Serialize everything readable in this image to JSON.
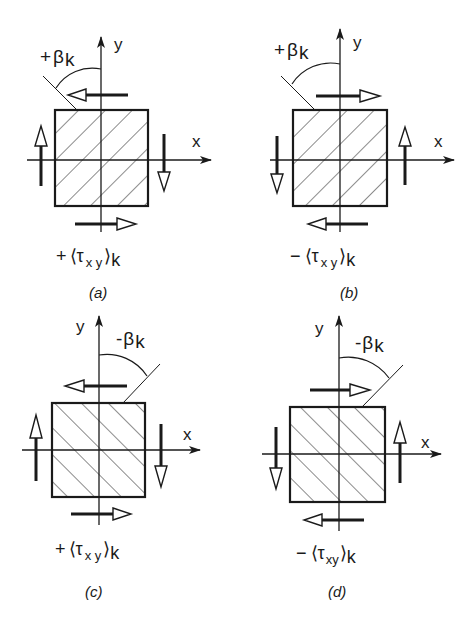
{
  "figure": {
    "panels": [
      {
        "id": "a",
        "panel_label": "(a)",
        "angle_label": "+βk",
        "angle_sign": "+",
        "shear_label": "+⟨τxy⟩k",
        "shear_sign": "+",
        "axis_x": "x",
        "axis_y": "y",
        "hatch_direction": "descending",
        "arrows": {
          "top": "left",
          "bottom": "right",
          "left": "up",
          "right": "down"
        }
      },
      {
        "id": "b",
        "panel_label": "(b)",
        "angle_label": "+βk",
        "angle_sign": "+",
        "shear_label": "−⟨τxy⟩k",
        "shear_sign": "−",
        "axis_x": "x",
        "axis_y": "y",
        "hatch_direction": "descending",
        "arrows": {
          "top": "right",
          "bottom": "left",
          "left": "down",
          "right": "up"
        }
      },
      {
        "id": "c",
        "panel_label": "(c)",
        "angle_label": "-βk",
        "angle_sign": "-",
        "shear_label": "+⟨τxy⟩k",
        "shear_sign": "+",
        "axis_x": "x",
        "axis_y": "y",
        "hatch_direction": "ascending",
        "arrows": {
          "top": "left",
          "bottom": "right",
          "left": "up",
          "right": "down"
        }
      },
      {
        "id": "d",
        "panel_label": "(d)",
        "angle_label": "-βk",
        "angle_sign": "-",
        "shear_label": "−⟨τxy⟩k",
        "shear_sign": "−",
        "axis_x": "x",
        "axis_y": "y",
        "hatch_direction": "ascending",
        "arrows": {
          "top": "right",
          "bottom": "left",
          "left": "down",
          "right": "up"
        }
      }
    ],
    "text": {
      "a_sign": "+",
      "a_beta": "β",
      "a_k": "k",
      "a_y": "y",
      "a_x": "x",
      "a_cap_sign": "+",
      "a_cap_open": "⟨τ",
      "a_cap_xy": "x y",
      "a_cap_close": "⟩",
      "a_cap_k": "k",
      "a_label": "(a)",
      "b_sign": "+",
      "b_beta": "β",
      "b_k": "k",
      "b_y": "y",
      "b_x": "x",
      "b_cap_sign": "−",
      "b_cap_open": "⟨τ",
      "b_cap_xy": "x y",
      "b_cap_close": "⟩",
      "b_cap_k": "k",
      "b_label": "(b)",
      "c_sign": "-",
      "c_beta": "β",
      "c_k": "k",
      "c_y": "y",
      "c_x": "x",
      "c_cap_sign": "+",
      "c_cap_open": "⟨τ",
      "c_cap_xy": "x y",
      "c_cap_close": "⟩",
      "c_cap_k": "k",
      "c_label": "(c)",
      "d_sign": "-",
      "d_beta": "β",
      "d_k": "k",
      "d_y": "y",
      "d_x": "x",
      "d_cap_sign": "−",
      "d_cap_open": "⟨τ",
      "d_cap_xy": "xy",
      "d_cap_close": "⟩",
      "d_cap_k": "k",
      "d_label": "(d)"
    },
    "colors": {
      "ink": "#1a1a1a",
      "background": "#ffffff"
    }
  }
}
